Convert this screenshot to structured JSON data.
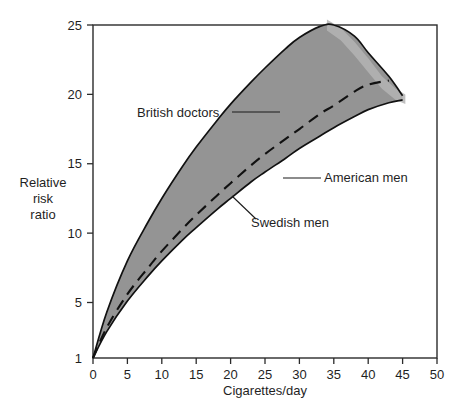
{
  "chart_data": {
    "type": "line",
    "title": "",
    "subtitle": "",
    "xlabel": "Cigarettes/day",
    "ylabel": "Relative risk ratio",
    "ylabel_lines": [
      "Relative",
      "risk",
      "ratio"
    ],
    "xlim": [
      0,
      50
    ],
    "ylim": [
      1,
      25
    ],
    "xticks": [
      0,
      5,
      10,
      15,
      20,
      25,
      30,
      35,
      40,
      45,
      50
    ],
    "xticklabels": [
      "0",
      "5",
      "10",
      "15",
      "20",
      "25",
      "30",
      "35",
      "40",
      "45",
      "50"
    ],
    "yticks": [
      1,
      5,
      10,
      15,
      20,
      25
    ],
    "yticklabels": [
      "1",
      "5",
      "10",
      "15",
      "20",
      "25"
    ],
    "grid": false,
    "legend": "annotations",
    "band_label": "Range between British doctors (upper) and Swedish men (lower)",
    "band_color": "#949494",
    "line_color": "#111111",
    "series": [
      {
        "name": "British doctors",
        "style": "solid",
        "role": "band-upper",
        "x": [
          0,
          2,
          5,
          8,
          10,
          13,
          15,
          18,
          20,
          23,
          25,
          28,
          30,
          33,
          35,
          38,
          40,
          43,
          45
        ],
        "y": [
          1,
          4.3,
          8.0,
          10.8,
          12.5,
          14.8,
          16.2,
          18.1,
          19.3,
          20.9,
          21.9,
          23.3,
          24.1,
          24.9,
          25.0,
          24.2,
          23.0,
          21.3,
          19.9
        ]
      },
      {
        "name": "American men",
        "style": "dashed",
        "role": "mid",
        "x": [
          0,
          2,
          5,
          8,
          10,
          13,
          15,
          18,
          20,
          23,
          25,
          28,
          30,
          33,
          35,
          38,
          40,
          43
        ],
        "y": [
          1,
          3.2,
          5.6,
          7.5,
          8.7,
          10.3,
          11.3,
          12.7,
          13.6,
          14.9,
          15.7,
          16.8,
          17.5,
          18.6,
          19.2,
          20.2,
          20.7,
          21.0
        ]
      },
      {
        "name": "Swedish men",
        "style": "solid",
        "role": "band-lower",
        "x": [
          0,
          2,
          5,
          8,
          10,
          13,
          15,
          18,
          20,
          23,
          25,
          28,
          30,
          33,
          35,
          38,
          40,
          43,
          45
        ],
        "y": [
          1,
          2.9,
          5.1,
          6.9,
          8.0,
          9.5,
          10.4,
          11.7,
          12.5,
          13.7,
          14.4,
          15.4,
          16.1,
          17.0,
          17.6,
          18.4,
          18.9,
          19.4,
          19.6
        ]
      }
    ],
    "annotations": [
      {
        "text": "British doctors",
        "x": 8.0,
        "y": 20.4,
        "anchor": "start",
        "leader_to_x": 21.5,
        "leader_to_y": 19.9
      },
      {
        "text": "American men",
        "x": 39.5,
        "y": 13.6,
        "anchor": "start",
        "leader_to_x": 30.5,
        "leader_to_y": 14.1
      },
      {
        "text": "Swedish men",
        "x": 29.0,
        "y": 10.3,
        "anchor": "start",
        "leader_to_x": 22.0,
        "leader_to_y": 13.4
      }
    ]
  },
  "axes": {
    "x_title": "Cigarettes/day",
    "y_title_lines": [
      "Relative",
      "risk",
      "ratio"
    ],
    "x_tick_labels": [
      "0",
      "5",
      "10",
      "15",
      "20",
      "25",
      "30",
      "35",
      "40",
      "45",
      "50"
    ],
    "y_tick_labels": [
      "25",
      "20",
      "15",
      "10",
      "5",
      "1"
    ]
  },
  "annotations": {
    "british_doctors": "British doctors",
    "american_men": "American men",
    "swedish_men": "Swedish men"
  }
}
